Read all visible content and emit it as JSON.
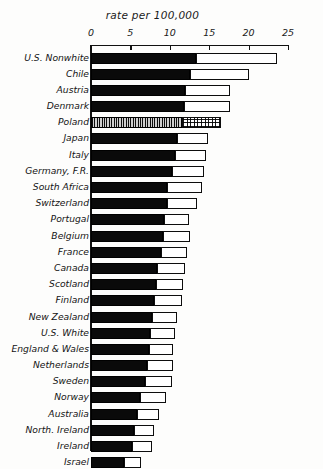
{
  "chart_data": {
    "type": "bar",
    "orientation": "horizontal",
    "stacked": true,
    "title": "rate per 100,000",
    "xlabel": "rate per 100,000",
    "ylabel": "",
    "xlim": [
      0,
      25
    ],
    "xticks": [
      0,
      5,
      10,
      15,
      20,
      25
    ],
    "xtick_labels": [
      "0",
      "5",
      "10",
      "15",
      "20",
      "25"
    ],
    "grid": false,
    "legend": "none",
    "categories": [
      "U.S. Nonwhite",
      "Chile",
      "Austria",
      "Denmark",
      "Poland",
      "Japan",
      "Italy",
      "Germany, F.R.",
      "South Africa",
      "Switzerland",
      "Portugal",
      "Belgium",
      "France",
      "Canada",
      "Scotland",
      "Finland",
      "New Zealand",
      "U.S. White",
      "England & Wales",
      "Netherlands",
      "Sweden",
      "Norway",
      "Australia",
      "North. Ireland",
      "Ireland",
      "Israel"
    ],
    "series": [
      {
        "name": "dark segment",
        "values": [
          13.3,
          12.6,
          11.9,
          11.8,
          11.5,
          10.9,
          10.6,
          10.3,
          9.7,
          9.6,
          9.3,
          9.1,
          8.9,
          8.4,
          8.3,
          8.0,
          7.8,
          7.5,
          7.3,
          7.1,
          6.9,
          6.2,
          5.8,
          5.5,
          5.2,
          4.2
        ]
      },
      {
        "name": "light segment",
        "values": [
          10.3,
          7.4,
          5.7,
          5.8,
          5.0,
          4.0,
          4.0,
          4.0,
          4.4,
          3.8,
          3.2,
          3.5,
          3.3,
          3.5,
          3.4,
          3.6,
          3.1,
          3.1,
          3.1,
          3.3,
          3.4,
          3.3,
          2.8,
          2.5,
          2.5,
          2.2
        ]
      }
    ],
    "totals": [
      23.6,
      20.0,
      17.6,
      17.6,
      16.5,
      14.9,
      14.6,
      14.3,
      14.1,
      13.4,
      12.5,
      12.6,
      12.2,
      11.9,
      11.7,
      11.6,
      10.9,
      10.6,
      10.4,
      10.4,
      10.3,
      9.5,
      8.6,
      8.0,
      7.7,
      6.4
    ]
  },
  "styling": {
    "bar_dark_color": "#0a0a0a",
    "bar_light_color": "#ffffff",
    "bar_outline_color": "#0d0d0d",
    "axis_color": "#111111",
    "background": "#fdfdfc",
    "highlight_row": "Poland",
    "highlight_pattern": "hatched"
  }
}
